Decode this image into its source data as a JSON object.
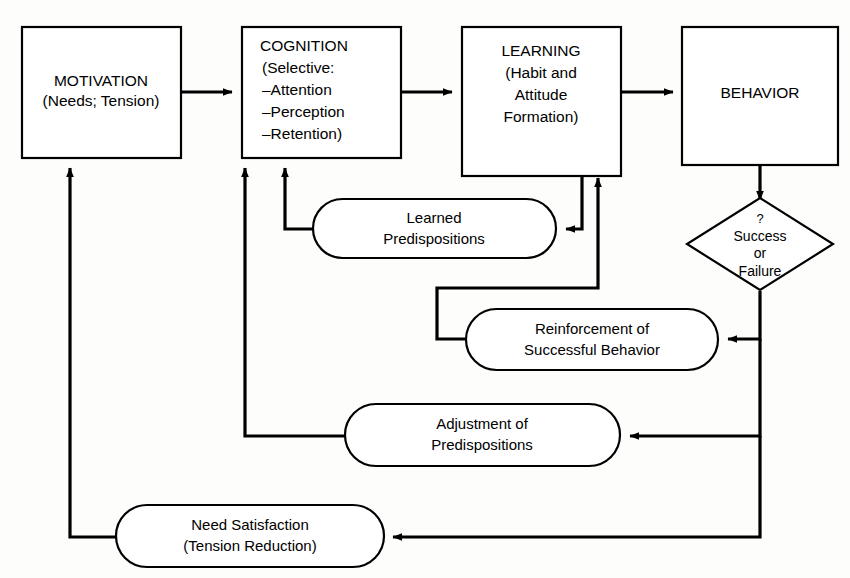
{
  "diagram": {
    "type": "flowchart",
    "background_color": "#fdfdfb",
    "line_color": "#000000",
    "node_fill": "#ffffff"
  },
  "nodes": {
    "motivation": {
      "shape": "rectangle",
      "line1": "MOTIVATION",
      "line2": "(Needs; Tension)"
    },
    "cognition": {
      "shape": "rectangle",
      "line1": "COGNITION",
      "line2": "(Selective:",
      "line3": "–Attention",
      "line4": "–Perception",
      "line5": "–Retention)"
    },
    "learning": {
      "shape": "rectangle",
      "line1": "LEARNING",
      "line2": "(Habit and",
      "line3": "Attitude",
      "line4": "Formation)"
    },
    "behavior": {
      "shape": "rectangle",
      "line1": "BEHAVIOR"
    },
    "decision": {
      "shape": "diamond",
      "qmark": "?",
      "line1": "Success",
      "line2": "or",
      "line3": "Failure"
    },
    "learned_predispositions": {
      "shape": "pill",
      "line1": "Learned",
      "line2": "Predispositions"
    },
    "reinforcement": {
      "shape": "pill",
      "line1": "Reinforcement of",
      "line2": "Successful Behavior"
    },
    "adjustment": {
      "shape": "pill",
      "line1": "Adjustment of",
      "line2": "Predispositions"
    },
    "need_satisfaction": {
      "shape": "pill",
      "line1": "Need Satisfaction",
      "line2": "(Tension Reduction)"
    }
  },
  "edges": [
    {
      "id": "motivation-to-cognition",
      "from": "motivation",
      "to": "cognition",
      "arrow": "right"
    },
    {
      "id": "cognition-to-learning",
      "from": "cognition",
      "to": "learning",
      "arrow": "right"
    },
    {
      "id": "learning-to-behavior",
      "from": "learning",
      "to": "behavior",
      "arrow": "right"
    },
    {
      "id": "behavior-to-decision",
      "from": "behavior",
      "to": "decision",
      "arrow": "down"
    },
    {
      "id": "learning-to-learned-predispositions",
      "from": "learning",
      "to": "learned_predispositions",
      "arrow": "left"
    },
    {
      "id": "learned-predispositions-to-cognition",
      "from": "learned_predispositions",
      "to": "cognition",
      "arrow": "up"
    },
    {
      "id": "decision-to-reinforcement",
      "from": "decision",
      "to": "reinforcement",
      "arrow": "left"
    },
    {
      "id": "reinforcement-to-learning",
      "from": "reinforcement",
      "to": "learning",
      "arrow": "up"
    },
    {
      "id": "decision-to-adjustment",
      "from": "decision",
      "to": "adjustment",
      "arrow": "left"
    },
    {
      "id": "adjustment-to-cognition",
      "from": "adjustment",
      "to": "cognition",
      "arrow": "up"
    },
    {
      "id": "decision-to-need-satisfaction",
      "from": "decision",
      "to": "need_satisfaction",
      "arrow": "left"
    },
    {
      "id": "need-satisfaction-to-motivation",
      "from": "need_satisfaction",
      "to": "motivation",
      "arrow": "up"
    }
  ]
}
